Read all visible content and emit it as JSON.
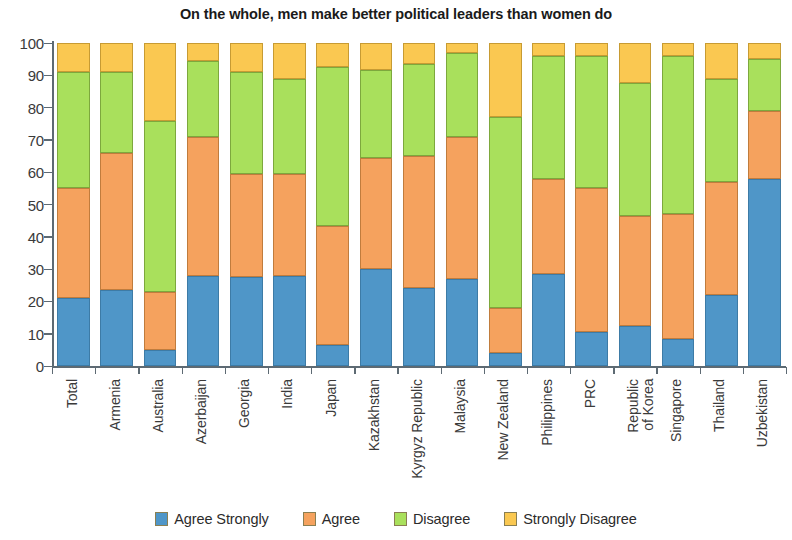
{
  "chart_data": {
    "type": "bar",
    "subtype": "stacked-percentage-column",
    "title": "On the whole, men make better political leaders than women do",
    "xlabel": "",
    "ylabel": "",
    "ylim": [
      0,
      100
    ],
    "y_ticks": [
      0,
      10,
      20,
      30,
      40,
      50,
      60,
      70,
      80,
      90,
      100
    ],
    "grid": false,
    "legend_position": "bottom",
    "categories": [
      "Total",
      "Armenia",
      "Australia",
      "Azerbaijan",
      "Georgia",
      "India",
      "Japan",
      "Kazakhstan",
      "Kyrgyz Republic",
      "Malaysia",
      "New Zealand",
      "Philippines",
      "PRC",
      "Republic\nof Korea",
      "Singapore",
      "Thailand",
      "Uzbekistan"
    ],
    "series": [
      {
        "name": "Agree Strongly",
        "color": "#4f96c8",
        "values": [
          21,
          23.5,
          5,
          28,
          27.5,
          28,
          6.5,
          30,
          24,
          27,
          4,
          28.5,
          10.5,
          12.5,
          8.5,
          22,
          58
        ]
      },
      {
        "name": "Agree",
        "color": "#f5a25e",
        "values": [
          34,
          42.5,
          18,
          43,
          32,
          31.5,
          37,
          34.5,
          41,
          44,
          14,
          29.5,
          44.5,
          34,
          38.5,
          35,
          21
        ]
      },
      {
        "name": "Disagree",
        "color": "#a9e05c",
        "values": [
          36,
          25,
          53,
          23.5,
          31.5,
          29.5,
          49,
          27,
          28.5,
          26,
          59,
          38,
          41,
          41,
          49,
          32,
          16
        ]
      },
      {
        "name": "Strongly Disagree",
        "color": "#fac851",
        "values": [
          9,
          9,
          24,
          5.5,
          9,
          11,
          7.5,
          8.5,
          6.5,
          3,
          23,
          4,
          4,
          12.5,
          4,
          11,
          5
        ]
      }
    ]
  },
  "legend": {
    "items": [
      {
        "label": "Agree Strongly",
        "color": "#4f96c8"
      },
      {
        "label": "Agree",
        "color": "#f5a25e"
      },
      {
        "label": "Disagree",
        "color": "#a9e05c"
      },
      {
        "label": "Strongly Disagree",
        "color": "#fac851"
      }
    ]
  }
}
